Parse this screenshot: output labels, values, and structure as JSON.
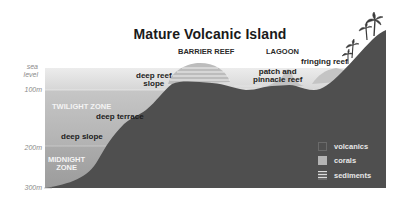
{
  "title": "Mature Volcanic Island",
  "zones": {
    "barrier_reef": "BARRIER REEF",
    "lagoon": "LAGOON",
    "twilight": "TWILIGHT ZONE",
    "midnight_line1": "MIDNIGHT",
    "midnight_line2": "ZONE"
  },
  "features": {
    "deep_reef_slope_1": "deep reef",
    "deep_reef_slope_2": "slope",
    "patch_1": "patch and",
    "patch_2": "pinnacle reef",
    "fringing_reef": "fringing reef",
    "deep_terrace": "deep terrace",
    "deep_slope": "deep slope"
  },
  "depth_axis": {
    "sea_level_1": "sea",
    "sea_level_2": "level",
    "d100": "100m",
    "d200": "200m",
    "d300": "300m"
  },
  "legend": [
    {
      "label": "volcanics",
      "color": "#4f4f4f"
    },
    {
      "label": "corals",
      "color": "#b4b4b4"
    },
    {
      "label": "sediments",
      "color": "#dcdcdc"
    }
  ],
  "colors": {
    "volcanics": "#4f4f4f",
    "corals": "#b4b4b4",
    "sunlit_water": "#e6e6e6",
    "twilight_water": "#bdbdbd",
    "midnight_water": "#a3a3a3"
  }
}
